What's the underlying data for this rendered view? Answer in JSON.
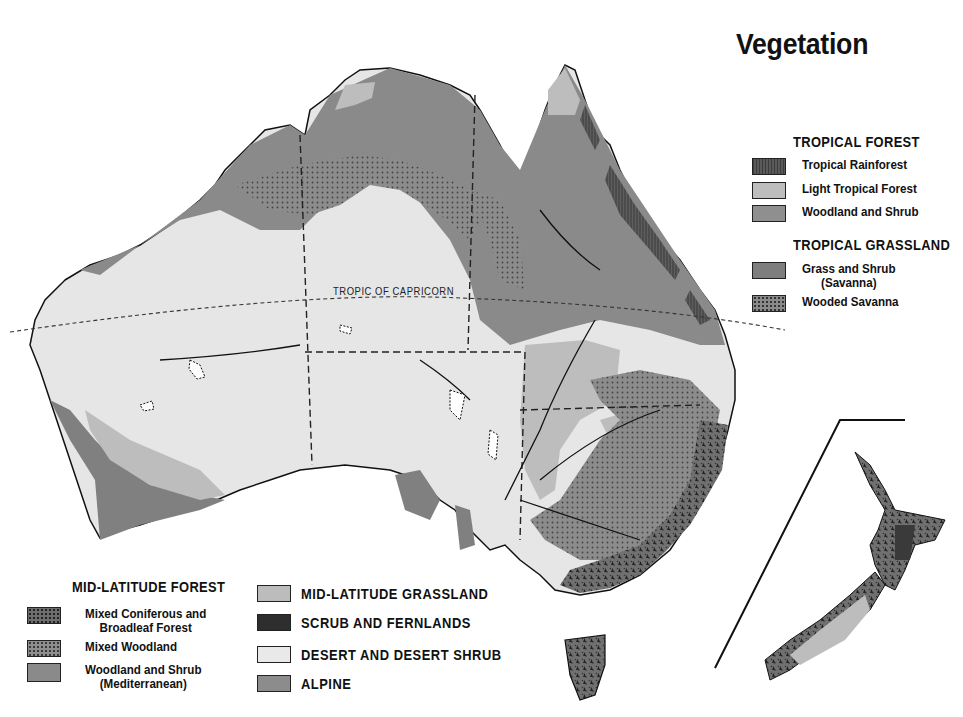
{
  "title": "Vegetation",
  "map": {
    "tropic_label": "TROPIC OF CAPRICORN",
    "regions": [
      "Australia",
      "Tasmania",
      "New Zealand (inset)"
    ]
  },
  "legend": {
    "tropical_forest": {
      "heading": "TROPICAL FOREST",
      "items": [
        {
          "label": "Tropical Rainforest",
          "pattern": "rain",
          "color": "#5a5a5a"
        },
        {
          "label": "Light Tropical Forest",
          "pattern": "light",
          "color": "#bdbdbd"
        },
        {
          "label": "Woodland and Shrub",
          "pattern": "wood",
          "color": "#8f8f8f"
        }
      ]
    },
    "tropical_grassland": {
      "heading": "TROPICAL GRASSLAND",
      "items": [
        {
          "label": "Grass and Shrub",
          "sublabel": "(Savanna)",
          "pattern": "grass",
          "color": "#7e7e7e"
        },
        {
          "label": "Wooded Savanna",
          "pattern": "wsav",
          "color": "#8a8a8a"
        }
      ]
    },
    "mid_latitude_forest": {
      "heading": "MID-LATITUDE FOREST",
      "items": [
        {
          "label": "Mixed Coniferous and",
          "sublabel": "Broadleaf Forest",
          "pattern": "conif",
          "color": "#6e6e6e"
        },
        {
          "label": "Mixed Woodland",
          "pattern": "mixw",
          "color": "#8e8e8e"
        },
        {
          "label": "Woodland and Shrub",
          "sublabel": "(Mediterranean)",
          "pattern": "med",
          "color": "#8a8a8a"
        }
      ]
    },
    "other": {
      "items": [
        {
          "label": "MID-LATITUDE GRASSLAND",
          "pattern": "mgrass",
          "color": "#bcbcbc"
        },
        {
          "label": "SCRUB AND FERNLANDS",
          "pattern": "scrub",
          "color": "#2e2e2e"
        },
        {
          "label": "DESERT AND DESERT SHRUB",
          "pattern": "desert",
          "color": "#e9e9e9"
        },
        {
          "label": "ALPINE",
          "pattern": "alpine",
          "color": "#8c8c8c"
        }
      ]
    }
  }
}
